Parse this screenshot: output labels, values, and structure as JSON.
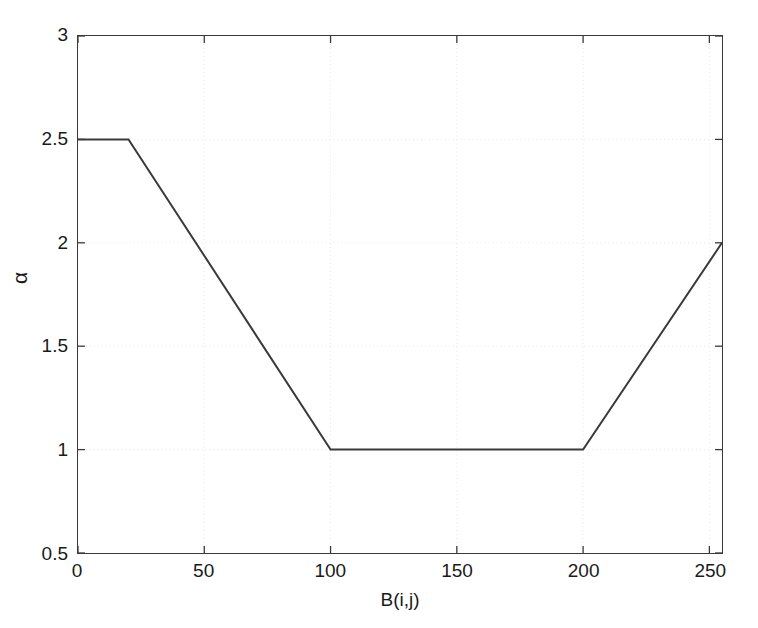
{
  "chart_data": {
    "type": "line",
    "title": "",
    "xlabel": "B(i,j)",
    "ylabel": "α",
    "xlim": [
      0,
      255
    ],
    "ylim": [
      0.5,
      3
    ],
    "xticks": [
      0,
      50,
      100,
      150,
      200,
      250
    ],
    "xticklabels": [
      "0",
      "50",
      "100",
      "150",
      "200",
      "250"
    ],
    "yticks": [
      0.5,
      1,
      1.5,
      2,
      2.5,
      3
    ],
    "yticklabels": [
      "0.5",
      "1",
      "1.5",
      "2",
      "2.5",
      "3"
    ],
    "grid": true,
    "grid_style": "dotted",
    "legend": null,
    "series": [
      {
        "name": "alpha",
        "color": "#3a3a3a",
        "linewidth": 2,
        "x": [
          0,
          20,
          100,
          200,
          255
        ],
        "y": [
          2.5,
          2.5,
          1,
          1,
          2
        ]
      }
    ],
    "annotations": [
      {
        "text": "plateau at alpha = 2.5 for B(i,j) in [0, 20]"
      },
      {
        "text": "linear decrease from 2.5 to 1 for B(i,j) in [20, 100]"
      },
      {
        "text": "plateau at alpha = 1 for B(i,j) in [100, 200]"
      },
      {
        "text": "linear increase from 1 to 2 for B(i,j) in [200, 255]"
      }
    ]
  },
  "figure": {
    "background_color": "#ffffff",
    "axis_color": "#3a3a3a",
    "grid_color": "#e6e6e6",
    "text_color": "#1a1a1a"
  }
}
